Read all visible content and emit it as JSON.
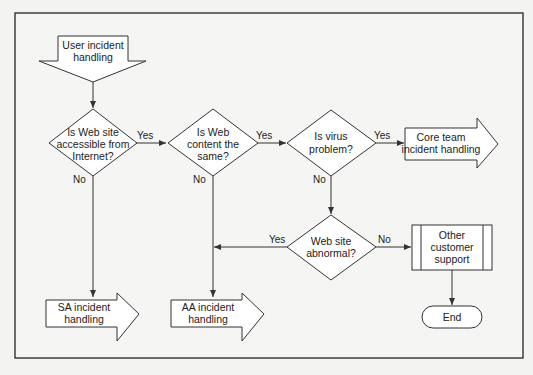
{
  "diagram": {
    "type": "flowchart",
    "nodes": {
      "start": {
        "shape": "down-arrow",
        "lines": [
          "User incident",
          "handling"
        ]
      },
      "q_accessible": {
        "shape": "decision",
        "lines": [
          "Is Web site",
          "accessible from",
          "Internet?"
        ]
      },
      "q_content": {
        "shape": "decision",
        "lines": [
          "Is Web",
          "content the",
          "same?"
        ]
      },
      "q_virus": {
        "shape": "decision",
        "lines": [
          "Is virus",
          "problem?"
        ]
      },
      "core_team": {
        "shape": "right-arrow",
        "lines": [
          "Core team",
          "incident handling"
        ]
      },
      "q_abnormal": {
        "shape": "decision",
        "lines": [
          "Web site",
          "abnormal?"
        ]
      },
      "other_support": {
        "shape": "predefined-process",
        "lines": [
          "Other",
          "customer",
          "support"
        ]
      },
      "end": {
        "shape": "terminator",
        "lines": [
          "End"
        ]
      },
      "sa": {
        "shape": "right-arrow",
        "lines": [
          "SA incident",
          "handling"
        ]
      },
      "aa": {
        "shape": "right-arrow",
        "lines": [
          "AA incident",
          "handling"
        ]
      }
    },
    "edges": [
      {
        "from": "start",
        "to": "q_accessible",
        "label": ""
      },
      {
        "from": "q_accessible",
        "to": "q_content",
        "label": "Yes"
      },
      {
        "from": "q_accessible",
        "to": "sa",
        "label": "No"
      },
      {
        "from": "q_content",
        "to": "q_virus",
        "label": "Yes"
      },
      {
        "from": "q_content",
        "to": "aa",
        "label": "No"
      },
      {
        "from": "q_virus",
        "to": "core_team",
        "label": "Yes"
      },
      {
        "from": "q_virus",
        "to": "q_abnormal",
        "label": "No"
      },
      {
        "from": "q_abnormal",
        "to": "aa",
        "label": "Yes"
      },
      {
        "from": "q_abnormal",
        "to": "other_support",
        "label": "No"
      },
      {
        "from": "other_support",
        "to": "end",
        "label": ""
      }
    ]
  }
}
